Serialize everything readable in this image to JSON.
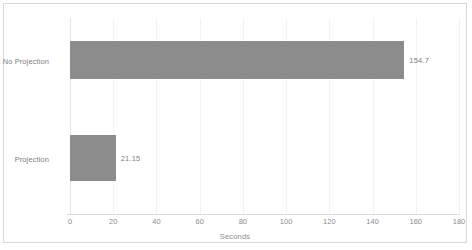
{
  "chart_data": {
    "type": "bar",
    "orientation": "horizontal",
    "title": "",
    "xlabel": "Seconds",
    "ylabel": "",
    "categories": [
      "No Projection",
      "Projection"
    ],
    "values": [
      154.7,
      21.15
    ],
    "value_labels": [
      "154.7",
      "21.15"
    ],
    "xlim": [
      0,
      180
    ],
    "xticks": [
      0,
      20,
      40,
      60,
      80,
      100,
      120,
      140,
      160,
      180
    ],
    "xtick_labels": [
      "0",
      "20",
      "40",
      "60",
      "80",
      "100",
      "120",
      "140",
      "160",
      "180"
    ],
    "grid": true,
    "grid_axis": "x",
    "legend": false,
    "series": [
      {
        "name": "Seconds",
        "values": [
          154.7,
          21.15
        ],
        "color": "#8c8c8c"
      }
    ]
  },
  "style": {
    "bar_color": "#8c8c8c",
    "grid_color": "#f2f2f2",
    "axis_color": "#d9d9d9",
    "border_color": "#d9d9d9",
    "text_color": "#808080",
    "tick_text_color": "#8c8c8c",
    "background": "#ffffff"
  }
}
